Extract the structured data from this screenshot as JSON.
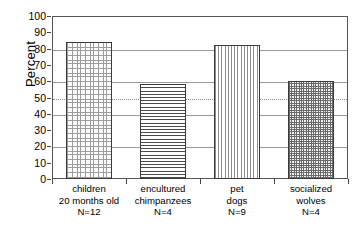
{
  "chart_data": {
    "type": "bar",
    "title": "",
    "xlabel": "",
    "ylabel": "Percent",
    "ylim": [
      0,
      100
    ],
    "ytick_step": 10,
    "yticks": [
      100,
      90,
      80,
      70,
      60,
      50,
      40,
      30,
      20,
      10,
      0
    ],
    "gridlines_at": [
      100,
      80,
      60,
      40,
      20,
      0
    ],
    "reference_line": {
      "value": 50,
      "style": "dotted",
      "label": ""
    },
    "grid": true,
    "legend": "none",
    "categories": [
      "children 20 months old N=12",
      "encultured chimpanzees N=4",
      "pet dogs N=9",
      "socialized wolves N=4"
    ],
    "values": [
      84,
      58,
      82,
      60
    ],
    "bars": [
      {
        "label_lines": [
          "children",
          "20 months old",
          "N=12"
        ],
        "group": "children",
        "sample_size": 12,
        "value": 84,
        "pattern": "crosshatch-light"
      },
      {
        "label_lines": [
          "encultured",
          "chimpanzees",
          "N=4"
        ],
        "group": "encultured chimpanzees",
        "sample_size": 4,
        "value": 58,
        "pattern": "horizontal-lines"
      },
      {
        "label_lines": [
          "pet",
          "dogs",
          "N=9"
        ],
        "group": "pet dogs",
        "sample_size": 9,
        "value": 82,
        "pattern": "vertical-lines"
      },
      {
        "label_lines": [
          "socialized",
          "wolves",
          "N=4"
        ],
        "group": "socialized wolves",
        "sample_size": 4,
        "value": 60,
        "pattern": "crosshatch-dark"
      }
    ],
    "colors": {
      "background": "#ffffff",
      "frame": "#555555",
      "gridline": "#9a9a9a",
      "reference_line": "#8a8a8a",
      "bar_outline": "#3a3a3a",
      "text": "#000000"
    }
  }
}
